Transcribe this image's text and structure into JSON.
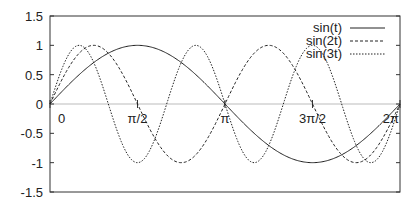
{
  "chart_data": {
    "type": "line",
    "title": "",
    "xlabel": "",
    "ylabel": "",
    "xlim": [
      0,
      6.2832
    ],
    "ylim": [
      -1.5,
      1.5
    ],
    "grid": false,
    "legend_position": "upper right",
    "yticks": [
      "1.5",
      "1",
      "0.5",
      "0",
      "-0.5",
      "-1",
      "-1.5"
    ],
    "xticks": [
      "0",
      "π/2",
      "π",
      "3π/2",
      "2π"
    ],
    "series": [
      {
        "name": "sin(t)",
        "style": "solid",
        "function": "sin(t)",
        "x": [
          0,
          0.785,
          1.571,
          2.356,
          3.142,
          3.927,
          4.712,
          5.498,
          6.283
        ],
        "values": [
          0,
          0.707,
          1,
          0.707,
          0,
          -0.707,
          -1,
          -0.707,
          0
        ]
      },
      {
        "name": "sin(2t)",
        "style": "dashed",
        "function": "sin(2t)",
        "x": [
          0,
          0.785,
          1.571,
          2.356,
          3.142,
          3.927,
          4.712,
          5.498,
          6.283
        ],
        "values": [
          0,
          1,
          0,
          -1,
          0,
          1,
          0,
          -1,
          0
        ]
      },
      {
        "name": "sin(3t)",
        "style": "dotted",
        "function": "sin(3t)",
        "x": [
          0,
          0.524,
          1.047,
          1.571,
          2.094,
          2.618,
          3.142,
          3.665,
          4.189,
          4.712,
          5.236,
          5.76,
          6.283
        ],
        "values": [
          0,
          1,
          0,
          -1,
          0,
          1,
          0,
          -1,
          0,
          1,
          0,
          -1,
          0
        ]
      }
    ]
  }
}
